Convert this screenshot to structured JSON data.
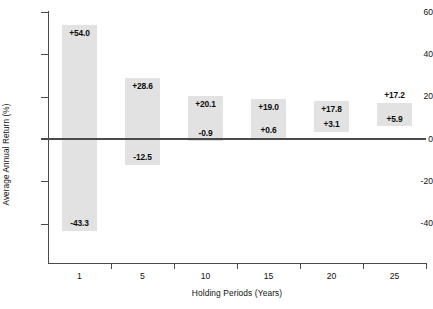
{
  "chart_data": {
    "type": "bar",
    "chart_subtype": "floating-range-bar",
    "title": "",
    "subtitle": "",
    "xlabel": "Holding Periods (Years)",
    "ylabel": "Average Annual Return (%)",
    "categories": [
      "1",
      "5",
      "10",
      "15",
      "20",
      "25"
    ],
    "series": [
      {
        "name": "Best Average Annual Return",
        "values": [
          54.0,
          28.6,
          20.1,
          19.0,
          17.8,
          17.2
        ]
      },
      {
        "name": "Worst Average Annual Return",
        "values": [
          -43.3,
          -12.5,
          -0.9,
          0.6,
          3.1,
          5.9
        ]
      }
    ],
    "bar_labels_high": [
      "+54.0",
      "+28.6",
      "+20.1",
      "+19.0",
      "+17.8",
      "+17.2"
    ],
    "bar_labels_low": [
      "-43.3",
      "-12.5",
      "-0.9",
      "+0.6",
      "+3.1",
      "+5.9"
    ],
    "ylim": [
      -48,
      60
    ],
    "yticks": [
      60,
      40,
      20,
      0,
      -20,
      -40
    ],
    "ytick_labels": [
      "60",
      "40",
      "20",
      "0",
      "-20",
      "-40"
    ],
    "xtick_labels": [
      "1",
      "5",
      "10",
      "15",
      "20",
      "25"
    ],
    "grid": false,
    "legend": "none",
    "zero_line": true,
    "bar_color": "#e2e2e2",
    "axis_color": "#4a4a4a",
    "text_color": "#111111"
  },
  "bars": [
    {
      "category": "1",
      "high_label": "+54.0",
      "low_label": "-43.3",
      "high": 54.0,
      "low": -43.3,
      "high_inside": true,
      "low_inside": true
    },
    {
      "category": "5",
      "high_label": "+28.6",
      "low_label": "-12.5",
      "high": 28.6,
      "low": -12.5,
      "high_inside": true,
      "low_inside": true
    },
    {
      "category": "10",
      "high_label": "+20.1",
      "low_label": "-0.9",
      "high": 20.1,
      "low": -0.9,
      "high_inside": true,
      "low_inside": true
    },
    {
      "category": "15",
      "high_label": "+19.0",
      "low_label": "+0.6",
      "high": 19.0,
      "low": 0.6,
      "high_inside": true,
      "low_inside": true
    },
    {
      "category": "20",
      "high_label": "+17.8",
      "low_label": "+3.1",
      "high": 17.8,
      "low": 3.1,
      "high_inside": true,
      "low_inside": true
    },
    {
      "category": "25",
      "high_label": "+17.2",
      "low_label": "+5.9",
      "high": 17.2,
      "low": 5.9,
      "high_inside": false,
      "low_inside": true
    }
  ],
  "axes": {
    "y_title": "Average Annual Return (%)",
    "x_title": "Holding Periods (Years)",
    "y_ticks": [
      "60",
      "40",
      "20",
      "0",
      "-20",
      "-40"
    ],
    "x_ticks": [
      "1",
      "5",
      "10",
      "15",
      "20",
      "25"
    ]
  }
}
